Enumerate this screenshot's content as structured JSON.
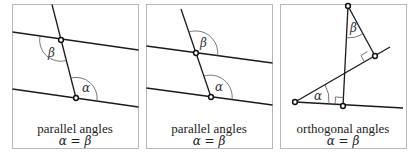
{
  "panels": [
    {
      "caption": "parallel angles",
      "equation": "α = β",
      "labels": {
        "alpha": "α",
        "beta": "β"
      }
    },
    {
      "caption": "parallel angles",
      "equation": "α = β",
      "labels": {
        "alpha": "α",
        "beta": "β"
      }
    },
    {
      "caption": "orthogonal angles",
      "equation": "α = β",
      "labels": {
        "alpha": "α",
        "beta": "β"
      }
    }
  ]
}
